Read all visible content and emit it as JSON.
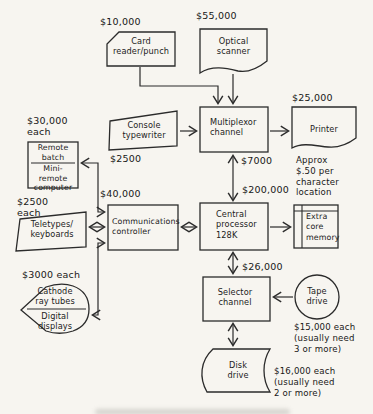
{
  "background": "#f7f5f0",
  "ink": "#2b2b2b",
  "nodes": {
    "card_reader": [
      "Card",
      "reader/punch"
    ],
    "optical_scanner": [
      "Optical",
      "scanner"
    ],
    "console_typewriter": [
      "Console",
      "typewriter"
    ],
    "multiplexor_channel": [
      "Multiplexor",
      "channel"
    ],
    "printer": [
      "Printer"
    ],
    "remote_batch": [
      "Remote",
      "batch"
    ],
    "mini_remote_computer": [
      "Mini-",
      "remote",
      "computer"
    ],
    "teletypes_keyboards": [
      "Teletypes/",
      "keyboards"
    ],
    "communications_controller": [
      "Communications",
      "controller"
    ],
    "central_processor": [
      "Central",
      "processor",
      "128K"
    ],
    "extra_core_memory": [
      "Extra",
      "core",
      "memory"
    ],
    "cathode_ray_tubes": [
      "Cathode",
      "ray tubes"
    ],
    "digital_displays": [
      "Digital",
      "displays"
    ],
    "selector_channel": [
      "Selector",
      "channel"
    ],
    "tape_drive": [
      "Tape",
      "drive"
    ],
    "disk_drive": [
      "Disk",
      "drive"
    ]
  },
  "costs": {
    "card_reader": "$10,000",
    "optical_scanner": "$55,000",
    "printer": "$25,000",
    "remote_batch": [
      "$30,000",
      "each"
    ],
    "console_typewriter": "$2500",
    "teletypes": [
      "$2500",
      "each"
    ],
    "communications_controller": "$40,000",
    "displays": "$3000 each",
    "multiplexor_link": "$7000",
    "central_processor": "$200,000",
    "selector_link": "$26,000"
  },
  "notes": {
    "extra_core": [
      "Approx",
      "$.50 per",
      "character",
      "location"
    ],
    "tape_drive": [
      "$15,000 each",
      "(usually need",
      "3 or more)"
    ],
    "disk_drive": [
      "$16,000 each",
      "(usually need",
      "2 or more)"
    ]
  }
}
